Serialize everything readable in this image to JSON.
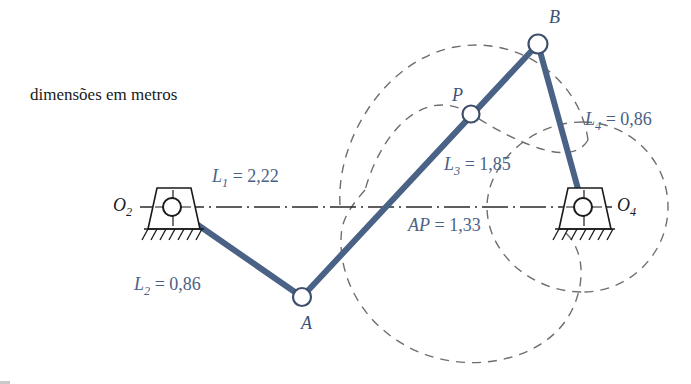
{
  "figure": {
    "caption": "dimensões em metros",
    "colors": {
      "link": "#4a6285",
      "label": "#4a6285",
      "curve": "#6a6a6a",
      "ground": "#1a1a1a",
      "centerline": "#2a2a2a"
    }
  },
  "pivots": [
    {
      "name": "O2",
      "label": "O",
      "sub": "2",
      "x": 172,
      "y": 207
    },
    {
      "name": "O4",
      "label": "O",
      "sub": "4",
      "x": 583,
      "y": 207
    }
  ],
  "joints": [
    {
      "name": "A",
      "label": "A",
      "x": 302,
      "y": 297
    },
    {
      "name": "B",
      "label": "B",
      "x": 538,
      "y": 44
    },
    {
      "name": "P",
      "label": "P",
      "x": 471,
      "y": 114
    }
  ],
  "dimensions": [
    {
      "name": "L1",
      "sym": "L",
      "sub": "1",
      "eq": "=",
      "value": "2,22",
      "text": "L1 = 2,22",
      "x": 212,
      "y": 167
    },
    {
      "name": "L2",
      "sym": "L",
      "sub": "2",
      "eq": "=",
      "value": "0,86",
      "text": "L2 = 0,86",
      "x": 134,
      "y": 275
    },
    {
      "name": "L3",
      "sym": "L",
      "sub": "3",
      "eq": "=",
      "value": "1,85",
      "text": "L3 = 1,85",
      "x": 444,
      "y": 155
    },
    {
      "name": "L4",
      "sym": "L",
      "sub": "4",
      "eq": "=",
      "value": "0,86",
      "text": "L4 = 0,86",
      "x": 585,
      "y": 110
    },
    {
      "name": "AP",
      "sym": "AP",
      "sub": "",
      "eq": "=",
      "value": "1,33",
      "text": "AP = 1,33",
      "x": 408,
      "y": 216
    }
  ],
  "links": [
    {
      "name": "link-2-O2-A",
      "from": "O2",
      "to": "A"
    },
    {
      "name": "link-3-A-B",
      "from": "A",
      "to": "B"
    },
    {
      "name": "link-4-B-O4",
      "from": "B",
      "to": "O4"
    }
  ],
  "centerline": {
    "name": "ground-line-O2-O4",
    "from": "O2",
    "to": "O4"
  },
  "curves": [
    {
      "name": "circle-path-B",
      "description": "dashed circular arc traced by point B about O4"
    },
    {
      "name": "coupler-curve-P",
      "description": "dashed closed coupler curve traced by point P"
    }
  ]
}
